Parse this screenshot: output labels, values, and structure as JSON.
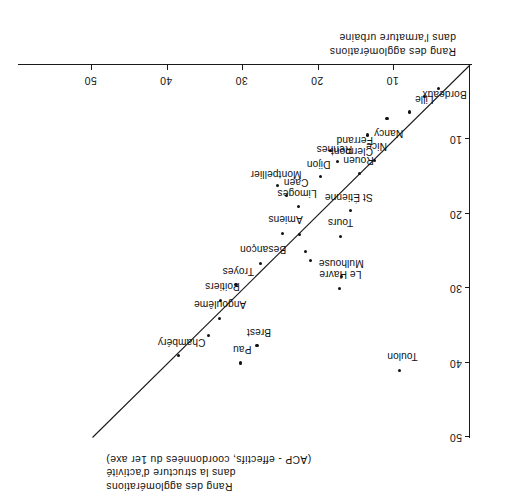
{
  "figure": {
    "orientation": "rotated-180",
    "axis_x_caption": [
      "Rang des agglomérations",
      "dans la structure d'activité",
      "(ACP - effectifs, coordonnées du 1er axe)"
    ],
    "axis_y_caption": [
      "Rang des agglomérations",
      "dans l'armature urbaine"
    ]
  },
  "chart_data": {
    "type": "scatter",
    "title": "",
    "xlabel": "Rang des agglomérations dans la structure d'activité (ACP - effectifs, coordonnées du 1er axe)",
    "ylabel": "Rang des agglomérations dans l'armature urbaine",
    "xlim": [
      0,
      55
    ],
    "ylim": [
      0,
      52
    ],
    "xticks": [
      10,
      20,
      30,
      40,
      50
    ],
    "yticks": [
      10,
      20,
      30,
      40,
      50
    ],
    "xtick_labels": [
      "10",
      "20",
      "30",
      "40",
      "50"
    ],
    "ytick_labels": [
      "10",
      "20",
      "30",
      "40",
      "50"
    ],
    "grid": false,
    "legend": null,
    "reference_line": {
      "label": "y = x",
      "from": [
        0,
        0
      ],
      "to": [
        50,
        50
      ]
    },
    "points": [
      {
        "label": "Bordeaux",
        "x": 6.0,
        "y": 4.2,
        "lx": -42,
        "ly": -3
      },
      {
        "label": "Lille",
        "x": 8.0,
        "y": 6.3,
        "lx": -24,
        "ly": 8
      },
      {
        "label": "",
        "x": 4.2,
        "y": 3.2,
        "lx": 0,
        "ly": 0
      },
      {
        "label": "",
        "x": 11.0,
        "y": 7.2,
        "lx": 0,
        "ly": 0
      },
      {
        "label": "Nancy",
        "x": 13.6,
        "y": 9.4,
        "lx": -36,
        "ly": -3
      },
      {
        "label": "Nice",
        "x": 12.6,
        "y": 12.8,
        "lx": -12,
        "ly": 9
      },
      {
        "label": "Rouen",
        "x": 14.6,
        "y": 14.6,
        "lx": -14,
        "ly": 9
      },
      {
        "label": "Rennes",
        "x": 18.5,
        "y": 11.5,
        "lx": -22,
        "ly": -3
      },
      {
        "label": "Clermont-\nFerrand",
        "x": 17.5,
        "y": 13.0,
        "lx": -35,
        "ly": 6
      },
      {
        "label": "Dijon",
        "x": 19.8,
        "y": 15.0,
        "lx": -10,
        "ly": 8
      },
      {
        "label": "St Étienne",
        "x": 15.8,
        "y": 19.5,
        "lx": -22,
        "ly": 8
      },
      {
        "label": "Montpellier",
        "x": 25.5,
        "y": 16.2,
        "lx": -24,
        "ly": 7
      },
      {
        "label": "Caen",
        "x": 24.3,
        "y": 17.5,
        "lx": -22,
        "ly": 8
      },
      {
        "label": "Limoges",
        "x": 22.7,
        "y": 19.0,
        "lx": -18,
        "ly": 9
      },
      {
        "label": "Tours",
        "x": 17.2,
        "y": 23.0,
        "lx": -13,
        "ly": 9
      },
      {
        "label": "Amiens",
        "x": 24.8,
        "y": 22.6,
        "lx": -20,
        "ly": 9
      },
      {
        "label": "",
        "x": 22.6,
        "y": 22.8,
        "lx": 0,
        "ly": 0
      },
      {
        "label": "",
        "x": 21.8,
        "y": 25.0,
        "lx": 0,
        "ly": 0
      },
      {
        "label": "",
        "x": 21.1,
        "y": 26.2,
        "lx": 0,
        "ly": 0
      },
      {
        "label": "Besançon",
        "x": 27.8,
        "y": 26.6,
        "lx": -26,
        "ly": 9
      },
      {
        "label": "Mulhouse",
        "x": 17.0,
        "y": 28.4,
        "lx": -22,
        "ly": 9
      },
      {
        "label": "Le Havre",
        "x": 17.3,
        "y": 30.0,
        "lx": -22,
        "ly": 9
      },
      {
        "label": "Troyes",
        "x": 31.0,
        "y": 29.5,
        "lx": -18,
        "ly": 9
      },
      {
        "label": "Poitiers",
        "x": 33.0,
        "y": 31.6,
        "lx": -19,
        "ly": 9
      },
      {
        "label": "Angoulême",
        "x": 33.2,
        "y": 34.0,
        "lx": -27,
        "ly": 9
      },
      {
        "label": "",
        "x": 34.6,
        "y": 36.3,
        "lx": 0,
        "ly": 0
      },
      {
        "label": "Brest",
        "x": 28.2,
        "y": 37.7,
        "lx": -14,
        "ly": 9
      },
      {
        "label": "Pau",
        "x": 30.4,
        "y": 40.0,
        "lx": -11,
        "ly": 9
      },
      {
        "label": "Chambéry",
        "x": 38.6,
        "y": 39.0,
        "lx": -27,
        "ly": 9
      },
      {
        "label": "Toulon",
        "x": 9.3,
        "y": 41.0,
        "lx": -18,
        "ly": 9
      }
    ]
  }
}
